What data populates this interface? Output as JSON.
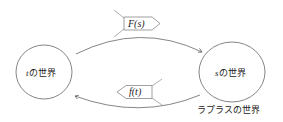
{
  "diagram": {
    "nodes": [
      {
        "id": "t-world",
        "var": "t",
        "label": "の世界"
      },
      {
        "id": "s-world",
        "var": "s",
        "label": "の世界"
      }
    ],
    "edges": [
      {
        "from": "t-world",
        "to": "s-world",
        "label": "F(s)"
      },
      {
        "from": "s-world",
        "to": "t-world",
        "label": "f(t)"
      }
    ],
    "caption": "ラプラスの世界",
    "colors": {
      "stroke": "#555555",
      "text": "#222222"
    }
  }
}
